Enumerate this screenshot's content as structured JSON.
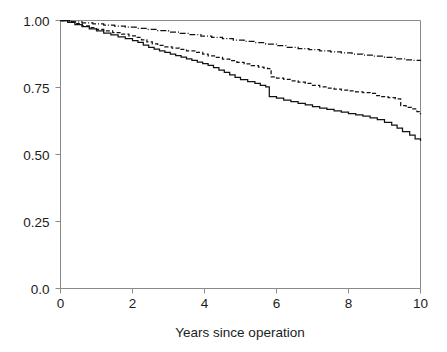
{
  "chart_data": {
    "type": "line",
    "title": "",
    "subtitle": "",
    "xlabel": "Years since operation",
    "ylabel": "",
    "xlim": [
      0,
      10
    ],
    "ylim": [
      0,
      1
    ],
    "grid": false,
    "legend": "none",
    "xticks": [
      0,
      2,
      4,
      6,
      8,
      10
    ],
    "xticklabels": [
      "0",
      "2",
      "4",
      "6",
      "8",
      "10"
    ],
    "yticks": [
      0.0,
      0.25,
      0.5,
      0.75,
      1.0
    ],
    "yticklabels": [
      "0.0",
      "0.25",
      "0.50",
      "0.75",
      "1.00"
    ],
    "step_type": "post",
    "series": [
      {
        "name": "curve-upper",
        "style": "dash-dot",
        "color": "#121212",
        "endpoint_value": 0.85,
        "x": [
          0.0,
          0.3,
          0.6,
          0.9,
          1.2,
          1.5,
          1.8,
          2.1,
          2.4,
          2.7,
          3.0,
          3.3,
          3.6,
          3.9,
          4.2,
          4.5,
          4.8,
          5.1,
          5.4,
          5.7,
          6.0,
          6.3,
          6.6,
          6.9,
          7.2,
          7.5,
          7.8,
          8.1,
          8.4,
          8.7,
          9.0,
          9.3,
          9.6,
          9.8,
          10.0
        ],
        "y": [
          1.0,
          0.995,
          0.991,
          0.987,
          0.983,
          0.979,
          0.975,
          0.971,
          0.967,
          0.962,
          0.957,
          0.952,
          0.947,
          0.942,
          0.937,
          0.932,
          0.927,
          0.922,
          0.917,
          0.912,
          0.906,
          0.9,
          0.895,
          0.891,
          0.887,
          0.883,
          0.879,
          0.875,
          0.871,
          0.867,
          0.862,
          0.857,
          0.853,
          0.851,
          0.85
        ]
      },
      {
        "name": "curve-middle",
        "style": "dashed",
        "color": "#121212",
        "endpoint_value": 0.65,
        "x": [
          0.0,
          0.25,
          0.45,
          0.6,
          0.8,
          1.0,
          1.2,
          1.45,
          1.7,
          1.9,
          2.1,
          2.25,
          2.4,
          2.55,
          2.7,
          2.9,
          3.1,
          3.3,
          3.5,
          3.75,
          3.95,
          4.1,
          4.3,
          4.5,
          4.7,
          4.9,
          5.1,
          5.3,
          5.5,
          5.65,
          5.75,
          5.85,
          6.0,
          6.2,
          6.4,
          6.6,
          6.8,
          7.0,
          7.2,
          7.4,
          7.6,
          7.8,
          8.0,
          8.2,
          8.4,
          8.6,
          8.75,
          8.9,
          9.1,
          9.3,
          9.45,
          9.6,
          9.75,
          9.9,
          10.0
        ],
        "y": [
          1.0,
          0.995,
          0.988,
          0.98,
          0.973,
          0.967,
          0.961,
          0.955,
          0.949,
          0.943,
          0.937,
          0.928,
          0.92,
          0.913,
          0.907,
          0.902,
          0.897,
          0.892,
          0.887,
          0.881,
          0.875,
          0.868,
          0.862,
          0.856,
          0.85,
          0.844,
          0.838,
          0.832,
          0.826,
          0.822,
          0.82,
          0.79,
          0.785,
          0.78,
          0.775,
          0.77,
          0.765,
          0.758,
          0.752,
          0.748,
          0.744,
          0.74,
          0.737,
          0.734,
          0.731,
          0.728,
          0.72,
          0.716,
          0.712,
          0.708,
          0.682,
          0.676,
          0.67,
          0.66,
          0.65
        ]
      },
      {
        "name": "curve-lower",
        "style": "solid",
        "color": "#121212",
        "endpoint_value": 0.55,
        "x": [
          0.0,
          0.2,
          0.4,
          0.6,
          0.8,
          1.0,
          1.2,
          1.4,
          1.6,
          1.8,
          2.0,
          2.15,
          2.3,
          2.45,
          2.6,
          2.75,
          2.9,
          3.05,
          3.2,
          3.35,
          3.5,
          3.65,
          3.8,
          3.95,
          4.1,
          4.25,
          4.4,
          4.55,
          4.7,
          4.85,
          5.0,
          5.2,
          5.4,
          5.55,
          5.7,
          5.8,
          6.0,
          6.2,
          6.4,
          6.6,
          6.8,
          7.0,
          7.2,
          7.4,
          7.6,
          7.8,
          8.0,
          8.2,
          8.4,
          8.6,
          8.8,
          9.0,
          9.2,
          9.35,
          9.5,
          9.7,
          9.85,
          10.0
        ],
        "y": [
          1.0,
          0.993,
          0.985,
          0.977,
          0.969,
          0.961,
          0.953,
          0.946,
          0.939,
          0.932,
          0.925,
          0.918,
          0.908,
          0.9,
          0.893,
          0.887,
          0.881,
          0.875,
          0.869,
          0.863,
          0.857,
          0.851,
          0.845,
          0.839,
          0.833,
          0.824,
          0.815,
          0.806,
          0.797,
          0.788,
          0.779,
          0.772,
          0.765,
          0.758,
          0.752,
          0.716,
          0.71,
          0.703,
          0.697,
          0.691,
          0.685,
          0.679,
          0.673,
          0.668,
          0.663,
          0.658,
          0.653,
          0.648,
          0.643,
          0.637,
          0.63,
          0.62,
          0.61,
          0.598,
          0.585,
          0.572,
          0.558,
          0.55
        ]
      }
    ]
  },
  "axes": {
    "x_title": "Years since operation"
  }
}
